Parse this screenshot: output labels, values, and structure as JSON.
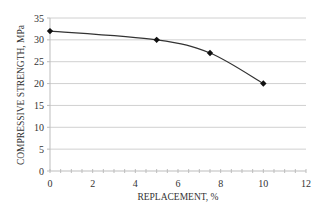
{
  "chart_data": {
    "type": "line",
    "title": "",
    "xlabel": "REPLACEMENT, %",
    "ylabel": "COMPRESSIVE STRENGTH, MPa",
    "x": [
      0,
      5,
      7.5,
      10
    ],
    "series": [
      {
        "name": "Compressive strength",
        "values": [
          32,
          30,
          27,
          20
        ],
        "color": "#333333",
        "marker": "diamond"
      }
    ],
    "xlim": [
      0,
      12
    ],
    "ylim": [
      0,
      35
    ],
    "xticks": [
      0,
      2,
      4,
      6,
      8,
      10,
      12
    ],
    "yticks": [
      0,
      5,
      10,
      15,
      20,
      25,
      30,
      35
    ],
    "grid": {
      "horizontal": true,
      "vertical": false,
      "color": "#d0d0d0"
    },
    "legend": null
  },
  "labels": {
    "xlabel": "REPLACEMENT, %",
    "ylabel": "COMPRESSIVE STRENGTH, MPa",
    "xticks": [
      "0",
      "2",
      "4",
      "6",
      "8",
      "10",
      "12"
    ],
    "yticks": [
      "0",
      "5",
      "10",
      "15",
      "20",
      "25",
      "30",
      "35"
    ]
  }
}
